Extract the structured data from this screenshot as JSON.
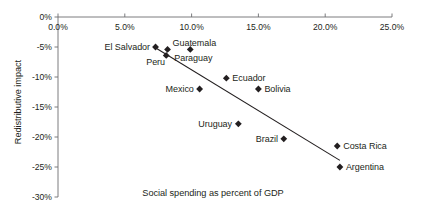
{
  "chart_data": {
    "type": "scatter",
    "title": "",
    "xlabel": "Social spending as percent of GDP",
    "ylabel": "Redistributive impact",
    "xlim": [
      0,
      25
    ],
    "ylim": [
      -30,
      0
    ],
    "grid": false,
    "legend": "none",
    "x_axis_position": "top",
    "xticks": [
      "0.0%",
      "5.0%",
      "10.0%",
      "15.0%",
      "20.0%",
      "25.0%"
    ],
    "xtick_values": [
      0,
      5,
      10,
      15,
      20,
      25
    ],
    "yticks": [
      "0%",
      "-5%",
      "-10%",
      "-15%",
      "-20%",
      "-25%",
      "-30%"
    ],
    "ytick_values": [
      0,
      -5,
      -10,
      -15,
      -20,
      -25,
      -30
    ],
    "points": [
      {
        "label": "El Salvador",
        "x": 7.3,
        "y": -5.0,
        "label_side": "left"
      },
      {
        "label": "Guatemala",
        "x": 8.2,
        "y": -5.4,
        "label_side": "right-top"
      },
      {
        "label": "Peru",
        "x": 8.1,
        "y": -6.4,
        "label_side": "left-bottom"
      },
      {
        "label": "Paraguay",
        "x": 9.9,
        "y": -5.4,
        "label_side": "bottom"
      },
      {
        "label": "Mexico",
        "x": 10.6,
        "y": -12.0,
        "label_side": "left"
      },
      {
        "label": "Ecuador",
        "x": 12.6,
        "y": -10.2,
        "label_side": "right"
      },
      {
        "label": "Bolivia",
        "x": 15.0,
        "y": -12.0,
        "label_side": "right"
      },
      {
        "label": "Uruguay",
        "x": 13.5,
        "y": -17.8,
        "label_side": "left"
      },
      {
        "label": "Brazil",
        "x": 16.9,
        "y": -20.3,
        "label_side": "left"
      },
      {
        "label": "Costa Rica",
        "x": 20.9,
        "y": -21.5,
        "label_side": "right"
      },
      {
        "label": "Argentina",
        "x": 21.1,
        "y": -25.0,
        "label_side": "right"
      }
    ],
    "trendline": {
      "x1": 7.2,
      "y1": -5.0,
      "x2": 21.1,
      "y2": -23.9
    },
    "colors": {
      "marker": "#231f20",
      "trendline": "#231f20",
      "axis": "#6d6e71",
      "text": "#231f20",
      "background": "#ffffff"
    }
  }
}
